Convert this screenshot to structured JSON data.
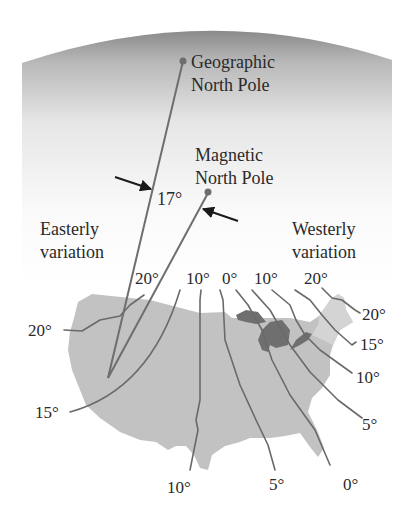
{
  "figure": {
    "type": "magnetic declination map",
    "colors": {
      "globe_dark": "#8c8c8c",
      "globe_light": "#ffffff",
      "land": "#c2c2c2",
      "lakes": "#6f6f6f",
      "northeast_land": "#d4d4d4",
      "lines": "#6a6a6a",
      "text": "#2a2a2a"
    },
    "labels": {
      "geographic_pole_line1": "Geographic",
      "geographic_pole_line2": "North Pole",
      "magnetic_pole_line1": "Magnetic",
      "magnetic_pole_line2": "North Pole",
      "angle": "17°",
      "easterly_line1": "Easterly",
      "easterly_line2": "variation",
      "westerly_line1": "Westerly",
      "westerly_line2": "variation"
    },
    "isogonic_top_labels": [
      "20°",
      "10°",
      "0°",
      "10°",
      "20°"
    ],
    "isogonic_side_labels": {
      "left_20": "20°",
      "left_15": "15°",
      "right_20": "20°",
      "right_15": "15°",
      "right_10": "10°",
      "right_5": "5°"
    },
    "isogonic_bottom_labels": {
      "b10": "10°",
      "b5": "5°",
      "b0": "0°"
    }
  }
}
